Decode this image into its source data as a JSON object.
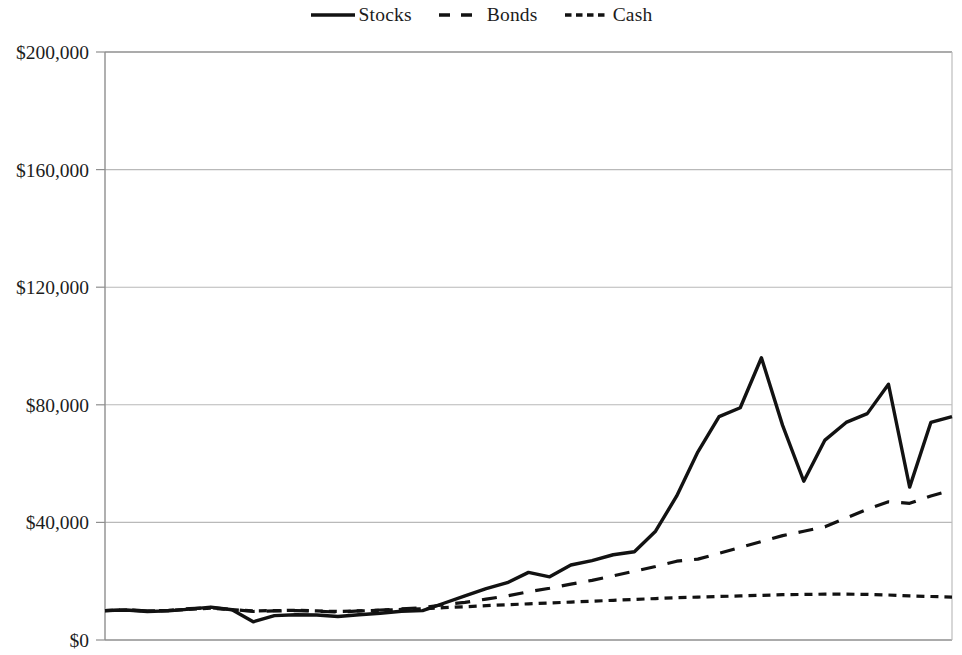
{
  "legend": {
    "position": "top-center",
    "entries": [
      {
        "label": "Stocks",
        "style": "solid",
        "icon": "solid-line-icon"
      },
      {
        "label": "Bonds",
        "style": "long-dash",
        "icon": "dashed-line-icon"
      },
      {
        "label": "Cash",
        "style": "short-dash",
        "icon": "dotted-line-icon"
      }
    ]
  },
  "axes": {
    "y_tick_labels": [
      "$200,000",
      "$160,000",
      "$120,000",
      "$80,000",
      "$40,000",
      "$0"
    ],
    "x_tick_labels": []
  },
  "chart_data": {
    "type": "line",
    "title": "",
    "subtitle": "",
    "xlabel": "",
    "ylabel": "",
    "ylim": [
      0,
      200000
    ],
    "ytick_values": [
      0,
      40000,
      80000,
      120000,
      160000,
      200000
    ],
    "ytick_labels": [
      "$0",
      "$40,000",
      "$80,000",
      "$120,000",
      "$160,000",
      "$200,000"
    ],
    "xlim": [
      0,
      40
    ],
    "grid": "horizontal",
    "legend_position": "top-center",
    "annotations": [],
    "x": [
      0,
      1,
      2,
      3,
      4,
      5,
      6,
      7,
      8,
      9,
      10,
      11,
      12,
      13,
      14,
      15,
      16,
      17,
      18,
      19,
      20,
      21,
      22,
      23,
      24,
      25,
      26,
      27,
      28,
      29,
      30,
      31,
      32,
      33,
      34,
      35,
      36,
      37,
      38,
      39,
      40
    ],
    "series": [
      {
        "name": "Stocks",
        "style": "solid",
        "color": "#121212",
        "values": [
          10000,
          10200,
          9700,
          9900,
          10500,
          11200,
          10300,
          6200,
          8300,
          8600,
          8500,
          8000,
          8600,
          9100,
          9800,
          10000,
          12500,
          15000,
          17500,
          19500,
          23000,
          21500,
          25500,
          27000,
          29000,
          30000,
          37000,
          49000,
          64000,
          76000,
          79000,
          96000,
          73000,
          54000,
          68000,
          74000,
          77000,
          87000,
          52000,
          74000,
          76000
        ]
      },
      {
        "name": "Bonds",
        "style": "long-dash",
        "color": "#121212",
        "values": [
          10000,
          10300,
          9900,
          10100,
          10700,
          11000,
          10400,
          9700,
          9900,
          10000,
          9800,
          9500,
          9900,
          10200,
          10600,
          11000,
          12000,
          12800,
          13900,
          15000,
          16400,
          17600,
          19000,
          20300,
          21800,
          23400,
          25000,
          26800,
          27500,
          29500,
          31500,
          33500,
          35500,
          37000,
          38500,
          41500,
          44500,
          47000,
          46500,
          49000,
          51000
        ]
      },
      {
        "name": "Cash",
        "style": "short-dash",
        "color": "#121212",
        "values": [
          10000,
          10200,
          9900,
          10000,
          10500,
          10800,
          10300,
          9900,
          10000,
          10100,
          9900,
          9700,
          9900,
          10100,
          10400,
          10600,
          11000,
          11300,
          11700,
          12000,
          12300,
          12600,
          12900,
          13200,
          13500,
          13800,
          14100,
          14400,
          14600,
          14800,
          15000,
          15200,
          15400,
          15500,
          15600,
          15600,
          15500,
          15300,
          15000,
          14800,
          14600
        ]
      }
    ]
  },
  "colors": {
    "line": "#121212",
    "grid": "#b9b9b9",
    "axis": "#8f8f8f",
    "background": "#ffffff",
    "text": "#1c1c1c"
  }
}
